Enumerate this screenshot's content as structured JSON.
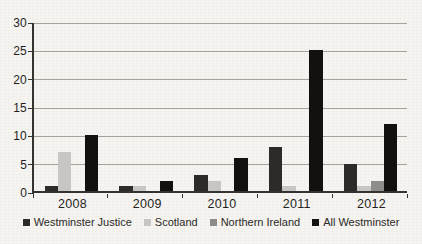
{
  "chart_data": {
    "type": "bar",
    "title": "",
    "xlabel": "",
    "ylabel": "",
    "categories": [
      "2008",
      "2009",
      "2010",
      "2011",
      "2012"
    ],
    "series": [
      {
        "name": "Westminster Justice",
        "color": "#2e2a29",
        "values": [
          1,
          1,
          3,
          8,
          5
        ]
      },
      {
        "name": "Scotland",
        "color": "#c7c6c2",
        "values": [
          7,
          1,
          2,
          1,
          1
        ]
      },
      {
        "name": "Northern Ireland",
        "color": "#8e8d89",
        "values": [
          0,
          0,
          0,
          0,
          2
        ]
      },
      {
        "name": "All Westminster",
        "color": "#121110",
        "values": [
          10,
          2,
          6,
          25,
          12
        ]
      }
    ],
    "ylim": [
      0,
      30
    ],
    "yticks": [
      0,
      5,
      10,
      15,
      20,
      25,
      30
    ],
    "grid": true,
    "legend_position": "bottom",
    "colors": {
      "background": "#f5f4f1",
      "axis": "#35322f",
      "gridline": "#a3a29d",
      "text": "#1f1e1c"
    }
  }
}
